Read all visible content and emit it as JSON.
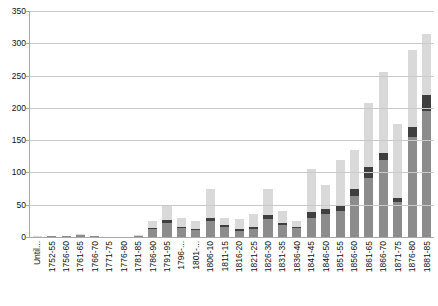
{
  "chart_data": {
    "type": "bar",
    "title": "",
    "subtitle": "",
    "xlabel": "",
    "ylabel": "",
    "ylim": [
      0,
      350
    ],
    "ytick_step": 50,
    "yticks": [
      0,
      50,
      100,
      150,
      200,
      250,
      300,
      350
    ],
    "ytick_labels": [
      "0",
      "50",
      "100",
      "150",
      "200",
      "250",
      "300",
      "350"
    ],
    "grid": true,
    "legend_position": "none",
    "stacked": true,
    "orientation": "vertical",
    "colors": {
      "series_bottom": "#8c8c8c",
      "series_middle": "#3f3f3f",
      "series_top": "#d9d9d9",
      "gridline": "#c9c9c9",
      "axis": "#a8a8a8",
      "background": "#ffffff",
      "text": "#111111"
    },
    "categories": [
      "Until...",
      "1752-55",
      "1756-60",
      "1761-65",
      "1766-70",
      "1771-75",
      "1776-80",
      "1781-85",
      "1786-90",
      "1791-95",
      "1796-...",
      "1801-...",
      "1806-10",
      "1811-15",
      "1816-20",
      "1821-25",
      "1826-30",
      "1831-35",
      "1836-40",
      "1841-45",
      "1846-50",
      "1851-55",
      "1856-60",
      "1861-65",
      "1866-70",
      "1871-75",
      "1876-80",
      "1881-85"
    ],
    "series": [
      {
        "name": "series-bottom",
        "color": "#8c8c8c",
        "values": [
          0,
          1,
          2,
          3,
          1,
          0,
          0,
          2,
          12,
          22,
          14,
          11,
          25,
          16,
          10,
          13,
          28,
          18,
          14,
          30,
          36,
          40,
          63,
          92,
          120,
          55,
          155,
          195
        ]
      },
      {
        "name": "series-middle",
        "color": "#3f3f3f",
        "values": [
          0,
          0,
          0,
          0,
          0,
          0,
          0,
          0,
          2,
          4,
          2,
          1,
          4,
          2,
          2,
          2,
          6,
          3,
          2,
          8,
          8,
          8,
          12,
          16,
          10,
          5,
          15,
          25
        ]
      },
      {
        "name": "series-top",
        "color": "#d9d9d9",
        "values": [
          1,
          1,
          0,
          1,
          1,
          0,
          0,
          1,
          11,
          22,
          14,
          13,
          46,
          12,
          16,
          20,
          41,
          19,
          9,
          67,
          36,
          72,
          60,
          99,
          125,
          115,
          120,
          95
        ]
      }
    ],
    "totals": [
      1,
      2,
      2,
      4,
      2,
      0,
      0,
      3,
      25,
      48,
      30,
      25,
      75,
      30,
      28,
      35,
      75,
      40,
      25,
      105,
      80,
      120,
      135,
      207,
      255,
      175,
      290,
      315
    ]
  }
}
